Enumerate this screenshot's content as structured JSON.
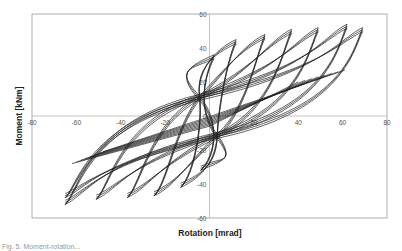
{
  "chart_data": {
    "type": "line",
    "title": "",
    "xlabel": "Rotation [mrad]",
    "ylabel": "Moment [kNm]",
    "xlim": [
      -80,
      80
    ],
    "ylim": [
      -60,
      60
    ],
    "x_ticks": [
      -80,
      -60,
      -40,
      -20,
      0,
      20,
      40,
      60,
      80
    ],
    "y_ticks": [
      -60,
      -40,
      -20,
      0,
      20,
      40,
      60
    ],
    "x_tick_labels": [
      "-80",
      "-60",
      "-40",
      "-20",
      "",
      "20",
      "40",
      "60",
      "80"
    ],
    "y_tick_labels": [
      "-60",
      "-40",
      "-20",
      "0",
      "20",
      "40",
      "60"
    ],
    "grid": false,
    "legend": null,
    "series": [
      {
        "name": "hysteresis",
        "loops": [
          {
            "pos_peak": [
              2,
              36
            ],
            "neg_peak": [
              -4,
              -32
            ]
          },
          {
            "pos_peak": [
              12,
              45
            ],
            "neg_peak": [
              -13,
              -42
            ]
          },
          {
            "pos_peak": [
              25,
              48
            ],
            "neg_peak": [
              -25,
              -47
            ]
          },
          {
            "pos_peak": [
              37,
              51
            ],
            "neg_peak": [
              -37,
              -48
            ]
          },
          {
            "pos_peak": [
              49,
              52
            ],
            "neg_peak": [
              -51,
              -49
            ]
          },
          {
            "pos_peak": [
              62,
              54
            ],
            "neg_peak": [
              -65,
              -52
            ]
          },
          {
            "pos_peak": [
              69,
              52
            ],
            "neg_peak": [
              -65,
              -48
            ]
          }
        ]
      }
    ]
  },
  "caption_partial": "Fig. 5. Moment-rotation..."
}
